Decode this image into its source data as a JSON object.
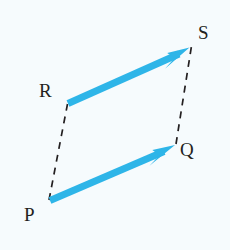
{
  "figure": {
    "kind": "vector-parallelogram-diagram",
    "background_color": "#f6fbfd",
    "canvas": {
      "width": 230,
      "height": 250
    },
    "vector_color": "#2eb5e8",
    "dashed_line_color": "#231f20",
    "label_color": "#231f20",
    "points": [
      {
        "id": "P",
        "label": "P",
        "x": 49,
        "y": 201,
        "label_x": 24,
        "label_y": 205
      },
      {
        "id": "Q",
        "label": "Q",
        "x": 175,
        "y": 145,
        "label_x": 180,
        "label_y": 140
      },
      {
        "id": "R",
        "label": "R",
        "x": 67,
        "y": 103,
        "label_x": 39,
        "label_y": 81
      },
      {
        "id": "S",
        "label": "S",
        "x": 190,
        "y": 47,
        "label_x": 198,
        "label_y": 23
      }
    ],
    "vectors": [
      {
        "id": "PQ",
        "name": "vector-p-to-q",
        "from": "P",
        "to": "Q",
        "style": "solid-arrow",
        "color": "#2eb5e8",
        "width": 7
      },
      {
        "id": "RS",
        "name": "vector-r-to-s",
        "from": "R",
        "to": "S",
        "style": "solid-arrow",
        "color": "#2eb5e8",
        "width": 7
      }
    ],
    "dashed_lines": [
      {
        "id": "PR",
        "name": "dashed-p-to-r",
        "from": "P",
        "to": "R",
        "style": "dashed",
        "color": "#231f20",
        "width": 1.6
      },
      {
        "id": "QS",
        "name": "dashed-q-to-s",
        "from": "Q",
        "to": "S",
        "style": "dashed",
        "color": "#231f20",
        "width": 1.6
      }
    ]
  }
}
